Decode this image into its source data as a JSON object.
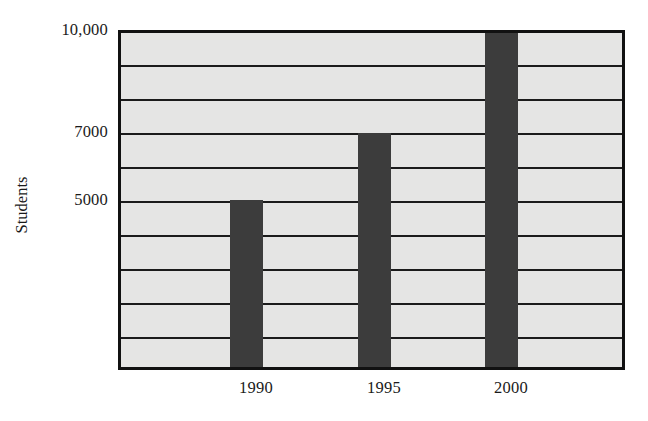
{
  "chart_data": {
    "type": "bar",
    "title": "",
    "subtitle": "",
    "xlabel": "",
    "ylabel": "Students",
    "categories": [
      "1990",
      "1995",
      "2000"
    ],
    "values": [
      5000,
      7000,
      10000
    ],
    "series": [
      {
        "name": "Students",
        "values": [
          5000,
          7000,
          10000
        ]
      }
    ],
    "ylim": [
      0,
      10000
    ],
    "y_tick_values": [
      5000,
      7000,
      10000
    ],
    "y_tick_labels": [
      "5000",
      "7000",
      "10,000"
    ],
    "gridline_values": [
      1000,
      2000,
      3000,
      4000,
      5000,
      6000,
      7000,
      8000,
      9000,
      10000
    ],
    "grid": "horizontal",
    "legend": "none",
    "bar_color": "#3c3c3c",
    "plot_background_color": "#e5e5e4",
    "axis_color": "#111111",
    "gridline_color": "#1b1b1b",
    "annotations": []
  },
  "axes": {
    "y_title": "Students",
    "y_labels": [
      {
        "text": "10,000",
        "value": 10000
      },
      {
        "text": "7000",
        "value": 7000
      },
      {
        "text": "5000",
        "value": 5000
      }
    ],
    "x_labels": [
      {
        "text": "1990",
        "value": 5000
      },
      {
        "text": "1995",
        "value": 7000
      },
      {
        "text": "2000",
        "value": 10000
      }
    ]
  }
}
